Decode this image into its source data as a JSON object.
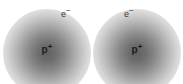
{
  "diagram": {
    "background_color": "#ffffff",
    "width": 183,
    "height": 84,
    "cloud_color": "#000000",
    "cloud_center_opacity": 0.62,
    "label_color": "#1c1c1c",
    "electron_label_color": "#3a3a3a",
    "atoms": [
      {
        "id": "atom-left",
        "center_x": 47,
        "center_y": 53,
        "radius": 44,
        "nucleus_symbol": "p",
        "nucleus_charge": "+",
        "electron_symbol": "e",
        "electron_charge": "−"
      },
      {
        "id": "atom-right",
        "center_x": 137,
        "center_y": 53,
        "radius": 44,
        "nucleus_symbol": "p",
        "nucleus_charge": "+",
        "electron_symbol": "e",
        "electron_charge": "−"
      }
    ]
  }
}
